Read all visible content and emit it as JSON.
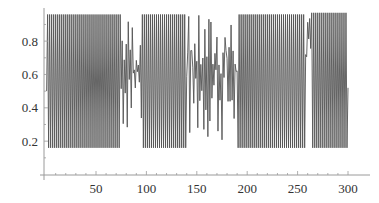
{
  "chart_data": {
    "type": "line",
    "title": "",
    "xlabel": "",
    "ylabel": "",
    "xlim": [
      0,
      305
    ],
    "ylim": [
      0,
      0.98
    ],
    "x_ticks": [
      50,
      100,
      150,
      200,
      250,
      300
    ],
    "x_tick_labels": [
      "50",
      "100",
      "150",
      "200",
      "250",
      "300"
    ],
    "y_ticks": [
      0.2,
      0.4,
      0.6,
      0.8
    ],
    "y_tick_labels": [
      "0.2",
      "0.4",
      "0.6",
      "0.8"
    ],
    "grid": false,
    "legend": null,
    "line_color": "#555555",
    "regimes": [
      {
        "x_start": 1,
        "x_end": 75,
        "kind": "period-2",
        "high": 0.96,
        "low": 0.16
      },
      {
        "x_start": 75,
        "x_end": 96,
        "kind": "chaotic",
        "range": [
          0.24,
          0.96
        ]
      },
      {
        "x_start": 96,
        "x_end": 140,
        "kind": "period-2",
        "high": 0.96,
        "low": 0.16
      },
      {
        "x_start": 140,
        "x_end": 191,
        "kind": "chaotic",
        "range": [
          0.18,
          0.96
        ]
      },
      {
        "x_start": 191,
        "x_end": 258,
        "kind": "period-2",
        "high": 0.96,
        "low": 0.16
      },
      {
        "x_start": 258,
        "x_end": 264,
        "kind": "transition",
        "range": [
          0.3,
          0.96
        ]
      },
      {
        "x_start": 264,
        "x_end": 300,
        "kind": "period-2",
        "high": 0.97,
        "low": 0.16
      }
    ],
    "n_points": 300,
    "first_value": 0.5,
    "last_value": 0.52
  },
  "axes": {
    "x_axis_label": "",
    "y_axis_label": ""
  }
}
